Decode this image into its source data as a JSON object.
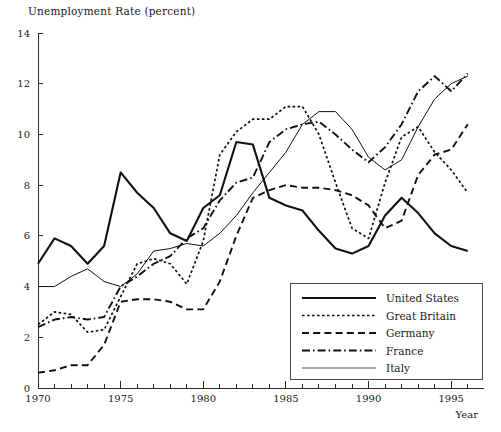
{
  "chart_data": {
    "type": "line",
    "title": "Unemployment Rate (percent)",
    "xlabel": "Year",
    "ylabel": "",
    "xlim": [
      1970,
      1996.5
    ],
    "ylim": [
      0,
      14
    ],
    "xticks": [
      1970,
      1975,
      1980,
      1985,
      1990,
      1995
    ],
    "xtick_labels": [
      "1970",
      "1975",
      "1980",
      "1985",
      "1990",
      "1995"
    ],
    "xminor_step": 1,
    "yticks": [
      0,
      2,
      4,
      6,
      8,
      10,
      12,
      14
    ],
    "ytick_labels": [
      "0",
      "2",
      "4",
      "6",
      "8",
      "10",
      "12",
      "14"
    ],
    "grid": false,
    "legend_position": "lower-right",
    "x": [
      1970,
      1971,
      1972,
      1973,
      1974,
      1975,
      1976,
      1977,
      1978,
      1979,
      1980,
      1981,
      1982,
      1983,
      1984,
      1985,
      1986,
      1987,
      1988,
      1989,
      1990,
      1991,
      1992,
      1993,
      1994,
      1995,
      1996
    ],
    "series": [
      {
        "name": "United States",
        "style": "solid",
        "width": 2.1,
        "color": "#111111",
        "values": [
          4.9,
          5.9,
          5.6,
          4.9,
          5.6,
          8.5,
          7.7,
          7.1,
          6.1,
          5.8,
          7.1,
          7.6,
          9.7,
          9.6,
          7.5,
          7.2,
          7.0,
          6.2,
          5.5,
          5.3,
          5.6,
          6.8,
          7.5,
          6.9,
          6.1,
          5.6,
          5.4
        ]
      },
      {
        "name": "Great Britain",
        "style": "dotted",
        "width": 1.7,
        "color": "#111111",
        "values": [
          2.5,
          3.0,
          2.9,
          2.2,
          2.3,
          3.6,
          4.9,
          5.1,
          4.9,
          4.1,
          5.8,
          9.2,
          10.1,
          10.6,
          10.6,
          11.1,
          11.1,
          10.0,
          8.1,
          6.3,
          5.9,
          8.1,
          9.9,
          10.3,
          9.3,
          8.6,
          7.7
        ]
      },
      {
        "name": "Germany",
        "style": "dashed",
        "width": 1.9,
        "color": "#111111",
        "values": [
          0.6,
          0.7,
          0.9,
          0.9,
          1.7,
          3.4,
          3.5,
          3.5,
          3.4,
          3.1,
          3.1,
          4.2,
          6.0,
          7.5,
          7.8,
          8.0,
          7.9,
          7.9,
          7.8,
          7.6,
          7.2,
          6.3,
          6.6,
          8.4,
          9.2,
          9.4,
          10.4
        ]
      },
      {
        "name": "France",
        "style": "dashdot",
        "width": 1.9,
        "color": "#111111",
        "values": [
          2.4,
          2.7,
          2.8,
          2.7,
          2.8,
          4.0,
          4.4,
          4.9,
          5.2,
          5.9,
          6.3,
          7.4,
          8.1,
          8.3,
          9.7,
          10.2,
          10.4,
          10.5,
          10.0,
          9.4,
          8.9,
          9.5,
          10.4,
          11.7,
          12.3,
          11.7,
          12.4
        ]
      },
      {
        "name": "Italy",
        "style": "solid-thin",
        "width": 1.0,
        "color": "#555555",
        "values": [
          4.0,
          4.0,
          4.4,
          4.7,
          4.2,
          4.0,
          4.5,
          5.4,
          5.5,
          5.7,
          5.6,
          6.1,
          6.8,
          7.7,
          8.5,
          9.3,
          10.4,
          10.9,
          10.9,
          10.2,
          9.1,
          8.6,
          9.0,
          10.3,
          11.4,
          12.0,
          12.3
        ]
      }
    ]
  },
  "legend": {
    "entries": [
      {
        "label": "United States"
      },
      {
        "label": "Great Britain"
      },
      {
        "label": "Germany"
      },
      {
        "label": "France"
      },
      {
        "label": "Italy"
      }
    ]
  }
}
